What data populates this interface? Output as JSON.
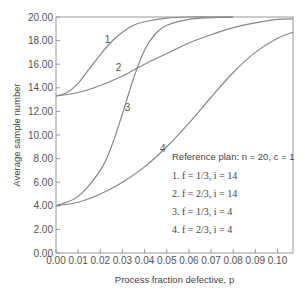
{
  "chart_data": {
    "type": "line",
    "title": "",
    "xlabel": "Process fraction defective, p",
    "ylabel": "Average sample number",
    "xlim": [
      0,
      0.107
    ],
    "ylim": [
      0,
      20
    ],
    "x_ticks": [
      "0.00",
      "0.01",
      "0.02",
      "0.03",
      "0.04",
      "0.05",
      "0.06",
      "0.07",
      "0.08",
      "0.09",
      "0.10"
    ],
    "y_ticks": [
      "0.00",
      "2.00",
      "4.00",
      "6.00",
      "8.00",
      "10.00",
      "12.00",
      "14.00",
      "16.00",
      "18.00",
      "20.00"
    ],
    "grid": false,
    "legend": {
      "title": "Reference plan: n = 20, c = 1",
      "entries": [
        "1. f = 1/3, i = 14",
        "2. f = 2/3, i = 14",
        "3. f = 1/3, i = 4",
        "4. f = 2/3, i = 4"
      ]
    },
    "series": [
      {
        "name": "1",
        "x": [
          0,
          0.005,
          0.01,
          0.015,
          0.02,
          0.025,
          0.03,
          0.035,
          0.04,
          0.05,
          0.06,
          0.07,
          0.08
        ],
        "y": [
          13.3,
          13.6,
          14.4,
          15.6,
          16.8,
          17.9,
          18.7,
          19.3,
          19.6,
          19.9,
          20,
          20,
          20
        ]
      },
      {
        "name": "2",
        "x": [
          0,
          0.01,
          0.02,
          0.03,
          0.04,
          0.05,
          0.06,
          0.07,
          0.08,
          0.09,
          0.1,
          0.107
        ],
        "y": [
          13.3,
          13.6,
          14.2,
          15.0,
          16.0,
          16.9,
          17.8,
          18.5,
          19.1,
          19.5,
          19.8,
          19.85
        ]
      },
      {
        "name": "3",
        "x": [
          0,
          0.01,
          0.02,
          0.025,
          0.03,
          0.035,
          0.04,
          0.045,
          0.05,
          0.06,
          0.07,
          0.08
        ],
        "y": [
          4.0,
          4.8,
          7.0,
          9.0,
          11.8,
          14.8,
          17.2,
          18.6,
          19.3,
          19.8,
          19.95,
          20
        ]
      },
      {
        "name": "4",
        "x": [
          0,
          0.01,
          0.02,
          0.03,
          0.04,
          0.05,
          0.06,
          0.07,
          0.08,
          0.09,
          0.1,
          0.107
        ],
        "y": [
          4.0,
          4.3,
          5.0,
          6.0,
          7.3,
          9.0,
          11.0,
          13.2,
          15.3,
          17.0,
          18.2,
          18.7
        ]
      }
    ],
    "curve_labels": [
      {
        "text": "1",
        "x": 0.022,
        "y": 17.8
      },
      {
        "text": "2",
        "x": 0.027,
        "y": 15.4
      },
      {
        "text": "3",
        "x": 0.031,
        "y": 12.0
      },
      {
        "text": "4",
        "x": 0.047,
        "y": 8.6
      }
    ]
  }
}
